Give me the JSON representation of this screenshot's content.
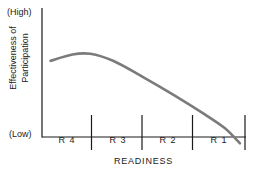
{
  "figure": {
    "y_axis": {
      "title_line1": "Effectiveness of",
      "title_line2": "Participation",
      "high_label": "(High)",
      "low_label": "(Low)"
    },
    "x_axis": {
      "title": "READINESS",
      "segments": [
        {
          "label": "R 4"
        },
        {
          "label": "R 3"
        },
        {
          "label": "R 2"
        },
        {
          "label": "R 1"
        }
      ]
    },
    "colors": {
      "curve": "#7b7b7b",
      "axis": "#1a1a1a",
      "background": "#ffffff"
    }
  },
  "chart_data": {
    "type": "line",
    "title": "",
    "xlabel": "READINESS",
    "ylabel": "Effectiveness of Participation",
    "categories": [
      "R 4",
      "R 3",
      "R 2",
      "R 1"
    ],
    "xlim": [
      0,
      4
    ],
    "ylim": [
      0,
      1
    ],
    "ytick_labels": [
      "(Low)",
      "(High)"
    ],
    "grid": false,
    "legend": null,
    "series": [
      {
        "name": "Effectiveness of Participation",
        "comment": "relative x (0=left axis, 4=right end), relative y (0=Low baseline, 1=High top)",
        "x": [
          0.17,
          0.6,
          0.95,
          1.4,
          2.0,
          2.6,
          3.2,
          3.6,
          3.9
        ],
        "y": [
          0.6,
          0.65,
          0.655,
          0.6,
          0.47,
          0.33,
          0.18,
          0.07,
          -0.05
        ]
      }
    ],
    "annotations": [
      "Curve rises slightly through R4, peaks near the R4/R3 boundary, then declines steadily and crosses the baseline inside R1."
    ]
  }
}
